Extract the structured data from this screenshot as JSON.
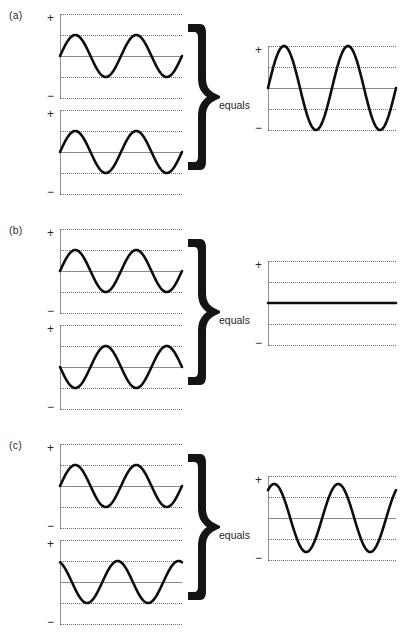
{
  "figure": {
    "type": "wave-interference-diagram",
    "panels": [
      {
        "id": "a",
        "label": "(a)",
        "relation_label": "equals",
        "description": "Two identical waves in phase combine constructively",
        "inputs": [
          {
            "name": "wave-1",
            "amplitude": 1,
            "cycles": 2,
            "phase_deg": 0,
            "offset": 0
          },
          {
            "name": "wave-2",
            "amplitude": 1,
            "cycles": 2,
            "phase_deg": 0,
            "offset": 0
          }
        ],
        "result": {
          "name": "resultant-wave",
          "amplitude": 2,
          "cycles": 2,
          "phase_deg": 0,
          "offset": 0
        }
      },
      {
        "id": "b",
        "label": "(b)",
        "relation_label": "equals",
        "description": "Two waves 180 degrees out of phase cancel completely",
        "inputs": [
          {
            "name": "wave-1",
            "amplitude": 1,
            "cycles": 2,
            "phase_deg": 0,
            "offset": 0
          },
          {
            "name": "wave-2",
            "amplitude": 1,
            "cycles": 2,
            "phase_deg": 180,
            "offset": 0
          }
        ],
        "result": {
          "name": "resultant-flat-line",
          "amplitude": 0,
          "cycles": 2,
          "phase_deg": 0,
          "offset": 0
        }
      },
      {
        "id": "c",
        "label": "(c)",
        "relation_label": "equals",
        "description": "Two waves partially out of phase combine to intermediate amplitude",
        "inputs": [
          {
            "name": "wave-1",
            "amplitude": 1,
            "cycles": 2,
            "phase_deg": 0,
            "offset": 0
          },
          {
            "name": "wave-2",
            "amplitude": 1,
            "cycles": 2,
            "phase_deg": 110,
            "offset": 0
          }
        ],
        "result": {
          "name": "resultant-wave",
          "amplitude": 1.62,
          "cycles": 2,
          "phase_deg": 55,
          "offset": 0
        }
      }
    ],
    "axis": {
      "positive_label": "+",
      "negative_label": "−",
      "gridline_levels": [
        2,
        1,
        0,
        -1,
        -2
      ],
      "zero_line_level": 0
    }
  },
  "chart_data": {
    "type": "line",
    "title": "",
    "xlabel": "",
    "ylabel": "",
    "ylim": [
      -2,
      2
    ],
    "grid": true,
    "legend": "none",
    "tick_labels": [
      "+",
      "−"
    ],
    "panels": [
      {
        "label": "(a)",
        "series": [
          {
            "name": "input-wave-1",
            "amplitude": 1,
            "phase_deg": 0,
            "cycles": 2
          },
          {
            "name": "input-wave-2",
            "amplitude": 1,
            "phase_deg": 0,
            "cycles": 2
          },
          {
            "name": "resultant",
            "amplitude": 2,
            "phase_deg": 0,
            "cycles": 2
          }
        ]
      },
      {
        "label": "(b)",
        "series": [
          {
            "name": "input-wave-1",
            "amplitude": 1,
            "phase_deg": 0,
            "cycles": 2
          },
          {
            "name": "input-wave-2",
            "amplitude": 1,
            "phase_deg": 180,
            "cycles": 2
          },
          {
            "name": "resultant",
            "amplitude": 0,
            "phase_deg": 0,
            "cycles": 2
          }
        ]
      },
      {
        "label": "(c)",
        "series": [
          {
            "name": "input-wave-1",
            "amplitude": 1,
            "phase_deg": 0,
            "cycles": 2
          },
          {
            "name": "input-wave-2",
            "amplitude": 1,
            "phase_deg": 110,
            "cycles": 2
          },
          {
            "name": "resultant",
            "amplitude": 1.62,
            "phase_deg": 55,
            "cycles": 2
          }
        ]
      }
    ]
  },
  "colors": {
    "curve": "#0d0d0d",
    "gridline": "#6e6e6e",
    "zero_line": "#8a8a8a",
    "axis": "#8f8f8f",
    "brace": "#141414",
    "text": "#1f1f1f",
    "background": "#ffffff"
  }
}
